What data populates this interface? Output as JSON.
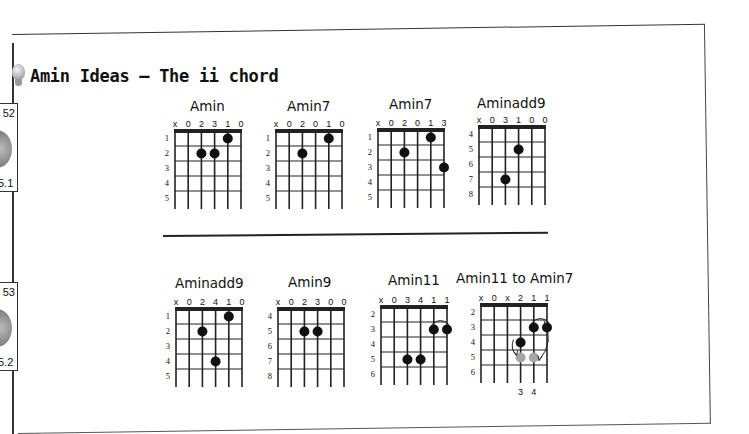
{
  "page": {
    "title": "Amin Ideas — The ii chord",
    "bulb_icon": "lightbulb-icon"
  },
  "side_tabs": [
    {
      "number": "52",
      "track": "5.1"
    },
    {
      "number": "53",
      "track": "5.2"
    }
  ],
  "colors": {
    "dot": "#111111",
    "ghost_dot": "#a6a6a6",
    "line": "#222222"
  },
  "chords": [
    {
      "name": "Amin",
      "top": [
        "x",
        "0",
        "2",
        "3",
        "1",
        "0"
      ],
      "frets": [
        "1",
        "2",
        "3",
        "4",
        "5"
      ],
      "dots": [
        {
          "string": 5,
          "fret": 1
        },
        {
          "string": 3,
          "fret": 2
        },
        {
          "string": 4,
          "fret": 2
        }
      ]
    },
    {
      "name": "Amin7",
      "top": [
        "x",
        "0",
        "2",
        "0",
        "1",
        "0"
      ],
      "frets": [
        "1",
        "2",
        "3",
        "4",
        "5"
      ],
      "dots": [
        {
          "string": 5,
          "fret": 1
        },
        {
          "string": 3,
          "fret": 2
        }
      ]
    },
    {
      "name": "Amin7",
      "top": [
        "x",
        "0",
        "2",
        "0",
        "1",
        "3"
      ],
      "frets": [
        "1",
        "2",
        "3",
        "4",
        "5"
      ],
      "dots": [
        {
          "string": 5,
          "fret": 1
        },
        {
          "string": 3,
          "fret": 2
        },
        {
          "string": 6,
          "fret": 3
        }
      ]
    },
    {
      "name": "Aminadd9",
      "top": [
        "x",
        "0",
        "3",
        "1",
        "0",
        "0"
      ],
      "frets": [
        "4",
        "5",
        "6",
        "7",
        "8"
      ],
      "dots": [
        {
          "string": 4,
          "fret": 2
        },
        {
          "string": 3,
          "fret": 4
        }
      ]
    },
    {
      "name": "Aminadd9",
      "top": [
        "x",
        "0",
        "2",
        "4",
        "1",
        "0"
      ],
      "frets": [
        "1",
        "2",
        "3",
        "4",
        "5"
      ],
      "dots": [
        {
          "string": 5,
          "fret": 1
        },
        {
          "string": 3,
          "fret": 2
        },
        {
          "string": 4,
          "fret": 4
        }
      ]
    },
    {
      "name": "Amin9",
      "top": [
        "x",
        "0",
        "2",
        "3",
        "0",
        "0"
      ],
      "frets": [
        "4",
        "5",
        "6",
        "7",
        "8"
      ],
      "dots": [
        {
          "string": 3,
          "fret": 2
        },
        {
          "string": 4,
          "fret": 2
        }
      ]
    },
    {
      "name": "Amin11",
      "top": [
        "x",
        "0",
        "3",
        "4",
        "1",
        "1"
      ],
      "frets": [
        "2",
        "3",
        "4",
        "5",
        "6"
      ],
      "dots": [
        {
          "string": 5,
          "fret": 2
        },
        {
          "string": 6,
          "fret": 2
        },
        {
          "string": 3,
          "fret": 4
        },
        {
          "string": 4,
          "fret": 4
        }
      ],
      "barre": {
        "from": 5,
        "to": 6,
        "fret": 2
      }
    },
    {
      "name": "Amin11 to Amin7",
      "top": [
        "x",
        "0",
        "x",
        "2",
        "1",
        "1"
      ],
      "frets": [
        "2",
        "3",
        "4",
        "5",
        "6"
      ],
      "dots": [
        {
          "string": 5,
          "fret": 2
        },
        {
          "string": 6,
          "fret": 2
        },
        {
          "string": 4,
          "fret": 3
        }
      ],
      "ghost_dots": [
        {
          "string": 4,
          "fret": 4
        },
        {
          "string": 5,
          "fret": 4
        }
      ],
      "barre": {
        "from": 5,
        "to": 6,
        "fret": 2
      },
      "bottom": [
        "3",
        "4"
      ]
    }
  ]
}
